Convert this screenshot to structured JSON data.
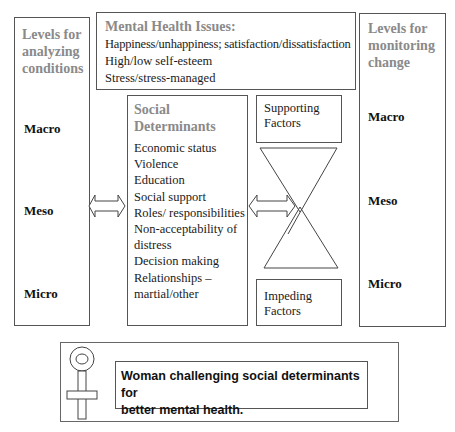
{
  "left_panel": {
    "title": "Levels for analyzing conditions",
    "title_lines": [
      "Levels for",
      "analyzing",
      "conditions"
    ],
    "levels": [
      "Macro",
      "Meso",
      "Micro"
    ]
  },
  "mental_health": {
    "title": "Mental Health Issues:",
    "items": [
      "Happiness/unhappiness; satisfaction/dissatisfaction",
      "High/low self-esteem",
      "Stress/stress-managed"
    ]
  },
  "right_panel": {
    "title": "Levels for monitoring change",
    "title_lines": [
      "Levels for",
      "monitoring",
      "change"
    ],
    "levels": [
      "Macro",
      "Meso",
      "Micro"
    ]
  },
  "social_determinants": {
    "title_lines": [
      "Social",
      "Determinants"
    ],
    "items": [
      "Economic status",
      "Violence",
      "Education",
      "Social support",
      "Roles/ responsibilities",
      "Non-acceptability of",
      "distress",
      "Decision making",
      "Relationships –",
      "martial/other"
    ]
  },
  "supporting_factors": {
    "lines": [
      "Supporting",
      "Factors"
    ]
  },
  "impeding_factors": {
    "lines": [
      "Impeding",
      "Factors"
    ]
  },
  "footer": {
    "icon": "female-symbol-icon",
    "lines": [
      "Woman challenging social determinants for",
      "better mental health."
    ]
  }
}
